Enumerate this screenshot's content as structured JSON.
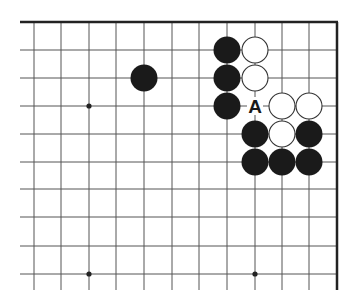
{
  "diagram": {
    "type": "go-board-partial",
    "view": "top-right corner",
    "columns": 12,
    "rows": 10,
    "edges": [
      "top",
      "right"
    ],
    "grid": {
      "col_x": [
        34,
        61,
        89,
        116,
        144,
        172,
        199,
        227,
        255,
        282,
        309,
        337
      ],
      "row_y": [
        22,
        50,
        78,
        106,
        134,
        162,
        189,
        217,
        246,
        274
      ],
      "left_extent": 20,
      "bottom_extent": 290
    },
    "star_points": [
      {
        "col": 2,
        "row": 3
      },
      {
        "col": 2,
        "row": 9
      },
      {
        "col": 8,
        "row": 9
      }
    ],
    "stones": [
      {
        "color": "black",
        "col": 4,
        "row": 2
      },
      {
        "color": "black",
        "col": 7,
        "row": 1
      },
      {
        "color": "black",
        "col": 7,
        "row": 2
      },
      {
        "color": "black",
        "col": 7,
        "row": 3
      },
      {
        "color": "white",
        "col": 8,
        "row": 1
      },
      {
        "color": "white",
        "col": 8,
        "row": 2
      },
      {
        "color": "white",
        "col": 9,
        "row": 3
      },
      {
        "color": "white",
        "col": 10,
        "row": 3
      },
      {
        "color": "black",
        "col": 8,
        "row": 4
      },
      {
        "color": "white",
        "col": 9,
        "row": 4
      },
      {
        "color": "black",
        "col": 10,
        "row": 4
      },
      {
        "color": "black",
        "col": 8,
        "row": 5
      },
      {
        "color": "black",
        "col": 9,
        "row": 5
      },
      {
        "color": "black",
        "col": 10,
        "row": 5
      }
    ],
    "labels": [
      {
        "text": "A",
        "col": 8,
        "row": 3
      }
    ],
    "colors": {
      "background": "#ffffff",
      "line": "#555555",
      "edge": "#222222",
      "black_stone": "#1a1a1a",
      "white_stone": "#ffffff",
      "white_outline": "#333333",
      "label": "#1a1a1a"
    }
  }
}
